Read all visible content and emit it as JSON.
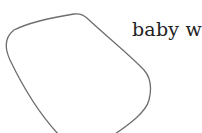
{
  "diagram": {
    "label": "baby w",
    "shape": {
      "kind": "closed-outline",
      "stroke_color": "#6e6e6e",
      "fill_color": "#ffffff"
    }
  }
}
